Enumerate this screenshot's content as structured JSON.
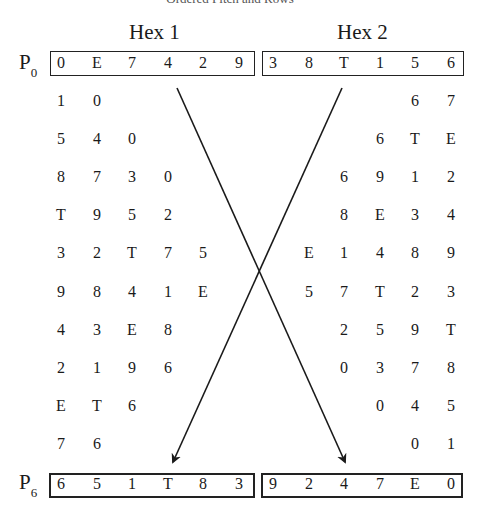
{
  "header": {
    "cut_title": "Ordered Pitch and Rows",
    "hex1_label": "Hex 1",
    "hex2_label": "Hex 2"
  },
  "row_labels": {
    "top": {
      "base": "P",
      "sub": "0"
    },
    "bottom": {
      "base": "P",
      "sub": "6"
    }
  },
  "top_row": {
    "hex1": [
      "0",
      "E",
      "7",
      "4",
      "2",
      "9"
    ],
    "hex2": [
      "3",
      "8",
      "T",
      "1",
      "5",
      "6"
    ]
  },
  "bottom_row": {
    "hex1": [
      "6",
      "5",
      "1",
      "T",
      "8",
      "3"
    ],
    "hex2": [
      "9",
      "2",
      "4",
      "7",
      "E",
      "0"
    ]
  },
  "left_triangle": [
    [
      "1",
      "0"
    ],
    [
      "5",
      "4",
      "0"
    ],
    [
      "8",
      "7",
      "3",
      "0"
    ],
    [
      "T",
      "9",
      "5",
      "2"
    ],
    [
      "3",
      "2",
      "T",
      "7",
      "5"
    ],
    [
      "9",
      "8",
      "4",
      "1",
      "E"
    ],
    [
      "4",
      "3",
      "E",
      "8"
    ],
    [
      "2",
      "1",
      "9",
      "6"
    ],
    [
      "E",
      "T",
      "6"
    ],
    [
      "7",
      "6"
    ]
  ],
  "right_triangle": [
    [
      "6",
      "7"
    ],
    [
      "6",
      "T",
      "E"
    ],
    [
      "6",
      "9",
      "1",
      "2"
    ],
    [
      "8",
      "E",
      "3",
      "4"
    ],
    [
      "E",
      "1",
      "4",
      "8",
      "9"
    ],
    [
      "5",
      "7",
      "T",
      "2",
      "3"
    ],
    [
      "2",
      "5",
      "9",
      "T"
    ],
    [
      "0",
      "3",
      "7",
      "8"
    ],
    [
      "0",
      "4",
      "5"
    ],
    [
      "0",
      "1"
    ]
  ],
  "arrows": [
    {
      "name": "hex1-to-hex2-arrow",
      "from": [
        177,
        88
      ],
      "to": [
        345,
        462
      ]
    },
    {
      "name": "hex2-to-hex1-arrow",
      "from": [
        342,
        88
      ],
      "to": [
        173,
        462
      ]
    }
  ]
}
